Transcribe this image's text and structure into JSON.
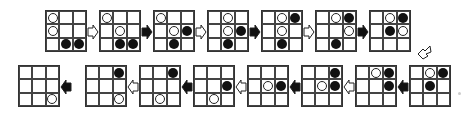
{
  "diagram": {
    "title": "",
    "colors": {
      "white_stone": "#ffffff",
      "black_stone": "#111111",
      "grid_line": "#333333"
    },
    "states": [
      {
        "id": 1,
        "row": "top",
        "white": [
          [
            0,
            0
          ],
          [
            1,
            0
          ]
        ],
        "black": [
          [
            2,
            1
          ],
          [
            2,
            2
          ]
        ]
      },
      {
        "id": 2,
        "row": "top",
        "white": [
          [
            0,
            0
          ],
          [
            1,
            1
          ]
        ],
        "black": [
          [
            2,
            1
          ],
          [
            2,
            2
          ]
        ]
      },
      {
        "id": 3,
        "row": "top",
        "white": [
          [
            0,
            0
          ],
          [
            1,
            1
          ]
        ],
        "black": [
          [
            1,
            2
          ],
          [
            2,
            1
          ]
        ]
      },
      {
        "id": 4,
        "row": "top",
        "white": [
          [
            0,
            1
          ],
          [
            1,
            1
          ]
        ],
        "black": [
          [
            1,
            2
          ],
          [
            2,
            1
          ]
        ]
      },
      {
        "id": 5,
        "row": "top",
        "white": [
          [
            0,
            1
          ],
          [
            1,
            1
          ]
        ],
        "black": [
          [
            0,
            2
          ],
          [
            2,
            1
          ]
        ]
      },
      {
        "id": 6,
        "row": "top",
        "white": [
          [
            0,
            1
          ],
          [
            1,
            2
          ]
        ],
        "black": [
          [
            0,
            2
          ],
          [
            2,
            1
          ]
        ]
      },
      {
        "id": 7,
        "row": "top",
        "white": [
          [
            0,
            1
          ],
          [
            1,
            2
          ]
        ],
        "black": [
          [
            0,
            2
          ],
          [
            1,
            1
          ]
        ]
      },
      {
        "id": 8,
        "row": "bottom",
        "white": [
          [
            0,
            1
          ]
        ],
        "black": [
          [
            0,
            2
          ],
          [
            1,
            1
          ]
        ]
      },
      {
        "id": 9,
        "row": "bottom",
        "white": [
          [
            0,
            1
          ]
        ],
        "black": [
          [
            0,
            2
          ],
          [
            1,
            2
          ]
        ]
      },
      {
        "id": 10,
        "row": "bottom",
        "white": [
          [
            1,
            1
          ]
        ],
        "black": [
          [
            0,
            2
          ],
          [
            1,
            2
          ]
        ]
      },
      {
        "id": 11,
        "row": "bottom",
        "white": [
          [
            1,
            1
          ]
        ],
        "black": [
          [
            1,
            2
          ]
        ]
      },
      {
        "id": 12,
        "row": "bottom",
        "white": [
          [
            2,
            1
          ]
        ],
        "black": [
          [
            1,
            2
          ]
        ]
      },
      {
        "id": 13,
        "row": "bottom",
        "white": [
          [
            2,
            1
          ]
        ],
        "black": [
          [
            0,
            2
          ]
        ]
      },
      {
        "id": 14,
        "row": "bottom",
        "white": [
          [
            2,
            2
          ]
        ],
        "black": [
          [
            0,
            2
          ]
        ]
      },
      {
        "id": 15,
        "row": "bottom",
        "white": [
          [
            2,
            2
          ]
        ],
        "black": []
      }
    ],
    "arrows": [
      {
        "from": 1,
        "to": 2,
        "style": "hollow",
        "direction": "right"
      },
      {
        "from": 2,
        "to": 3,
        "style": "filled",
        "direction": "right"
      },
      {
        "from": 3,
        "to": 4,
        "style": "hollow",
        "direction": "right"
      },
      {
        "from": 4,
        "to": 5,
        "style": "filled",
        "direction": "right"
      },
      {
        "from": 5,
        "to": 6,
        "style": "hollow",
        "direction": "right"
      },
      {
        "from": 6,
        "to": 7,
        "style": "filled",
        "direction": "right"
      },
      {
        "from": 7,
        "to": 8,
        "style": "hollow",
        "direction": "down-left"
      },
      {
        "from": 8,
        "to": 9,
        "style": "filled",
        "direction": "left"
      },
      {
        "from": 9,
        "to": 10,
        "style": "hollow",
        "direction": "left"
      },
      {
        "from": 10,
        "to": 11,
        "style": "filled",
        "direction": "left"
      },
      {
        "from": 11,
        "to": 12,
        "style": "hollow",
        "direction": "left"
      },
      {
        "from": 12,
        "to": 13,
        "style": "filled",
        "direction": "left"
      },
      {
        "from": 13,
        "to": 14,
        "style": "hollow",
        "direction": "left"
      },
      {
        "from": 14,
        "to": 15,
        "style": "filled",
        "direction": "left"
      }
    ]
  }
}
